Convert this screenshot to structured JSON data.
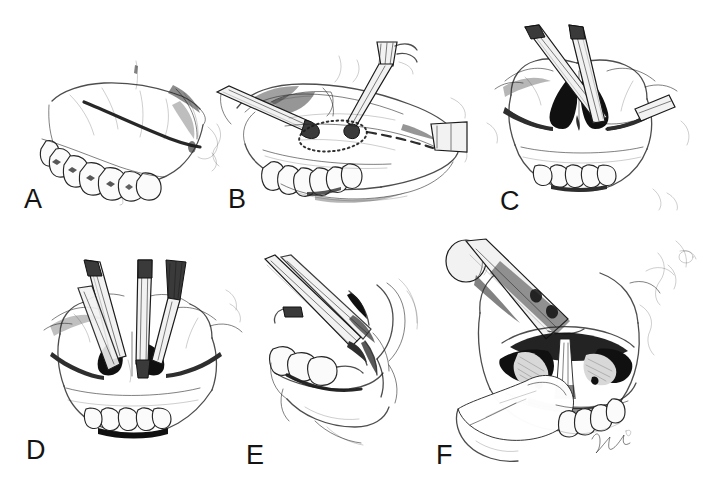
{
  "figure": {
    "width": 707,
    "height": 502,
    "background_color": "#ffffff",
    "ink_color": "#1b1b1b",
    "signature": "Nelson",
    "panels": [
      {
        "id": "A",
        "label": "A",
        "label_x": 24,
        "label_y": 186,
        "x": 40,
        "y": 55,
        "w": 185,
        "h": 150,
        "view": "lateral-maxilla",
        "description": "Lateral view of maxilla and maxillary teeth with a bold circumvestibular incision line marked across the lateral maxillary wall",
        "features": [
          "maxilla",
          "maxillary-teeth",
          "zygomatic-buttress",
          "incision-line"
        ]
      },
      {
        "id": "B",
        "label": "B",
        "label_x": 228,
        "label_y": 186,
        "x": 215,
        "y": 40,
        "w": 255,
        "h": 170,
        "view": "lateral-exposed-maxilla",
        "description": "Lateral view with soft tissue retracted, a retractor and a powered bur marking the Le Fort I osteotomy; dotted circle at the canine fossa and a dashed horizontal osteotomy line",
        "features": [
          "retractor",
          "bur-handpiece",
          "dotted-marking",
          "dashed-osteotomy-line",
          "maxillary-teeth",
          "lip-retraction"
        ]
      },
      {
        "id": "C",
        "label": "C",
        "label_x": 500,
        "label_y": 188,
        "x": 485,
        "y": 25,
        "w": 210,
        "h": 185,
        "view": "frontal-skull",
        "description": "Frontal view of the midface showing the piriform aperture in black, completed bilateral Le Fort I osteotomy cuts, and two reciprocating saw instruments crossing above the nose",
        "features": [
          "piriform-aperture",
          "nasal-cavity",
          "osteotomy-cut",
          "saw-instrument",
          "maxillary-teeth"
        ]
      },
      {
        "id": "D",
        "label": "D",
        "label_x": 26,
        "label_y": 437,
        "x": 40,
        "y": 260,
        "w": 205,
        "h": 190,
        "view": "frontal-skull",
        "description": "Frontal view of the midface with a guarded nasal septal osteotome and a straight osteotome seated in the piriform rim being malleted",
        "features": [
          "septal-osteotome",
          "straight-osteotome",
          "piriform-aperture",
          "nasal-septum",
          "maxillary-teeth"
        ]
      },
      {
        "id": "E",
        "label": "E",
        "label_x": 246,
        "label_y": 442,
        "x": 265,
        "y": 255,
        "w": 165,
        "h": 195,
        "view": "lateral-pterygomaxillary",
        "description": "Lateral close-up of the posterior maxilla with a curved pterygoid osteotome placed in the pterygomaxillary fissure while a finger protects the palate",
        "features": [
          "pterygoid-osteotome",
          "retractor",
          "maxillary-tuberosity",
          "pterygomaxillary-junction",
          "molar-teeth"
        ]
      },
      {
        "id": "F",
        "label": "F",
        "label_x": 436,
        "label_y": 442,
        "x": 440,
        "y": 235,
        "w": 255,
        "h": 235,
        "view": "frontal-downfractured-maxilla",
        "description": "Down-fractured maxilla held with a Rowe disimpaction forceps and digital pressure, exposing the nasal floor, nasal septum and inferior turbinates within the open nasal cavity",
        "features": [
          "rowe-disimpaction-forceps",
          "down-fractured-maxilla",
          "nasal-septum",
          "inferior-turbinate",
          "nasal-floor",
          "finger",
          "maxillary-teeth",
          "signature"
        ]
      }
    ]
  }
}
